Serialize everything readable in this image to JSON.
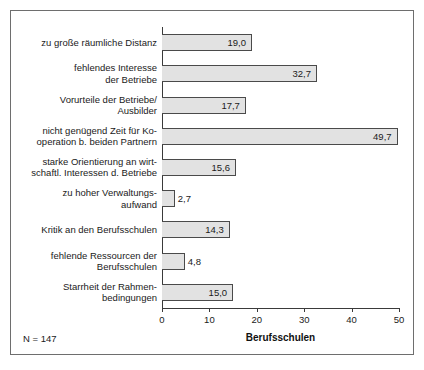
{
  "chart_data": {
    "type": "bar",
    "orientation": "horizontal",
    "title": "",
    "xlabel": "Berufsschulen",
    "ylabel": "",
    "xlim": [
      0,
      50
    ],
    "xticks": [
      "0",
      "10",
      "20",
      "30",
      "40",
      "50"
    ],
    "xtick_values": [
      0,
      10,
      20,
      30,
      40,
      50
    ],
    "grid": false,
    "legend": null,
    "categories": [
      "zu große räumliche Distanz",
      "fehlendes Interesse\nder Betriebe",
      "Vorurteile der Betriebe/\nAusbilder",
      "nicht genügend Zeit für Ko-\noperation b. beiden Partnern",
      "starke Orientierung an wirt-\nschaftl. Interessen d. Betriebe",
      "zu hoher Verwaltungs-\naufwand",
      "Kritik an den Berufsschulen",
      "fehlende Ressourcen der\nBerufsschulen",
      "Starrheit der Rahmen-\nbedingungen"
    ],
    "values": [
      19.0,
      32.7,
      17.7,
      49.7,
      15.6,
      2.7,
      14.3,
      4.8,
      15.0
    ],
    "value_labels": [
      "19,0",
      "32,7",
      "17,7",
      "49,7",
      "15,6",
      "2,7",
      "14,3",
      "4,8",
      "15,0"
    ],
    "bar_fill": "#e2e2e2",
    "bar_border": "#4a4a4a"
  },
  "annotations": {
    "sample_size": "N = 147"
  }
}
